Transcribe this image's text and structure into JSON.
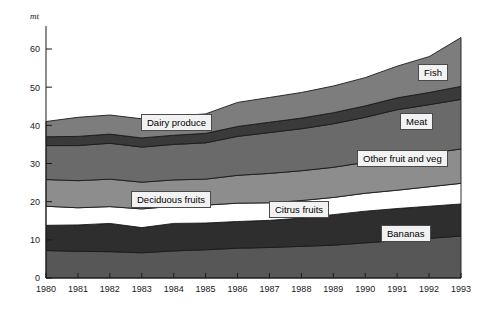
{
  "chart_data": {
    "type": "area",
    "stacked": true,
    "title": "",
    "subtitle": "",
    "xlabel": "",
    "ylabel": "mt",
    "unit_label": "mt",
    "grid": false,
    "legend_position": "inline-callouts",
    "categories": [
      "1980",
      "1981",
      "1982",
      "1983",
      "1984",
      "1985",
      "1986",
      "1987",
      "1988",
      "1989",
      "1990",
      "1991",
      "1992",
      "1993"
    ],
    "x": [
      1980,
      1981,
      1982,
      1983,
      1984,
      1985,
      1986,
      1987,
      1988,
      1989,
      1990,
      1991,
      1992,
      1993
    ],
    "xlim": [
      1980,
      1993
    ],
    "ylim": [
      0,
      65
    ],
    "yticks": [
      0,
      10,
      20,
      30,
      40,
      50,
      60
    ],
    "ytick_labels": [
      "0",
      "10",
      "20",
      "30",
      "40",
      "50",
      "60"
    ],
    "xtick_labels": [
      "1980",
      "1981",
      "1982",
      "1983",
      "1984",
      "1985",
      "1986",
      "1987",
      "1988",
      "1989",
      "1990",
      "1991",
      "1992",
      "1993"
    ],
    "series": [
      {
        "name": "Bananas",
        "order": 1,
        "color": "#575757",
        "values": [
          7.2,
          7.0,
          6.9,
          6.6,
          7.1,
          7.4,
          7.8,
          8.0,
          8.3,
          8.6,
          9.2,
          9.8,
          10.4,
          11.0
        ]
      },
      {
        "name": "Citrus fruits",
        "order": 2,
        "color": "#2e2e2e",
        "values": [
          6.6,
          6.9,
          7.4,
          6.6,
          7.2,
          7.0,
          7.0,
          7.1,
          7.4,
          8.0,
          8.3,
          8.4,
          8.4,
          8.4
        ]
      },
      {
        "name": "Deciduous fruits",
        "order": 3,
        "color": "#ffffff",
        "values": [
          5.0,
          4.5,
          4.4,
          4.9,
          4.5,
          4.7,
          4.8,
          4.6,
          4.6,
          4.5,
          4.7,
          4.8,
          5.1,
          5.4
        ]
      },
      {
        "name": "Other fruit and veg",
        "order": 4,
        "color": "#8d8d8d",
        "values": [
          7.0,
          7.1,
          7.2,
          7.0,
          6.9,
          6.8,
          7.3,
          7.7,
          7.8,
          7.9,
          8.1,
          8.6,
          8.8,
          9.0
        ]
      },
      {
        "name": "Meat",
        "order": 5,
        "color": "#6a6a6a",
        "values": [
          8.9,
          9.2,
          9.4,
          9.2,
          9.3,
          9.5,
          10.2,
          10.7,
          11.0,
          11.4,
          11.8,
          12.5,
          12.7,
          13.0
        ]
      },
      {
        "name": "Fish",
        "order": 6,
        "color": "#3a3a3a",
        "values": [
          2.3,
          2.4,
          2.4,
          2.4,
          2.4,
          2.5,
          2.6,
          2.7,
          2.8,
          2.9,
          3.0,
          3.1,
          3.2,
          3.4
        ]
      },
      {
        "name": "Top band",
        "order": 7,
        "color": "#7d7d7d",
        "values": [
          4.0,
          5.0,
          5.0,
          5.0,
          5.0,
          5.1,
          6.3,
          6.5,
          6.7,
          7.0,
          7.4,
          8.3,
          9.4,
          12.8
        ]
      }
    ],
    "totals": [
      41.0,
      42.1,
      42.7,
      41.7,
      42.4,
      43.0,
      46.0,
      47.3,
      48.6,
      50.3,
      52.5,
      55.5,
      58.0,
      63.0
    ],
    "callouts": [
      {
        "label": "Fish",
        "x": 418,
        "y": 64
      },
      {
        "label": "Dairy produce",
        "x": 141,
        "y": 114
      },
      {
        "label": "Meat",
        "x": 400,
        "y": 113
      },
      {
        "label": "Other fruit and veg",
        "x": 357,
        "y": 150
      },
      {
        "label": "Deciduous fruits",
        "x": 131,
        "y": 191
      },
      {
        "label": "Citrus fruits",
        "x": 269,
        "y": 201
      },
      {
        "label": "Bananas",
        "x": 381,
        "y": 225
      }
    ]
  }
}
